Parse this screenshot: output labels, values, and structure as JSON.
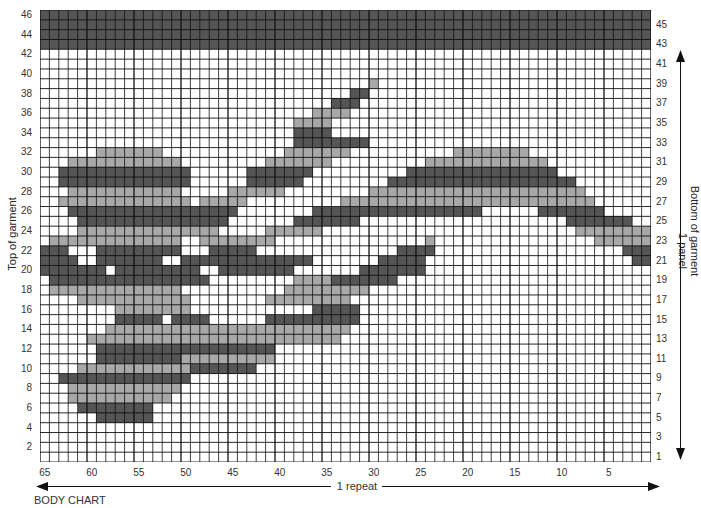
{
  "title": "BODY CHART",
  "left_axis_title": "Top of garment",
  "right_axis_title": "Bottom of garment",
  "right_axis_subtitle": "1 panel",
  "bottom_axis_title": "1 repeat",
  "grid": {
    "columns": 65,
    "rows": 46
  },
  "colors": {
    "light": "#a8a8a8",
    "dark": "#555555",
    "line": "#111111"
  },
  "left_row_labels": [
    "46",
    "44",
    "42",
    "40",
    "38",
    "36",
    "34",
    "32",
    "30",
    "28",
    "26",
    "24",
    "22",
    "20",
    "18",
    "16",
    "14",
    "12",
    "10",
    "8",
    "6",
    "4",
    "2"
  ],
  "right_row_labels": [
    "45",
    "43",
    "41",
    "39",
    "37",
    "35",
    "33",
    "31",
    "29",
    "27",
    "25",
    "23",
    "21",
    "19",
    "17",
    "15",
    "13",
    "11",
    "9",
    "7",
    "5",
    "3",
    "1"
  ],
  "column_labels": [
    "65",
    "60",
    "55",
    "50",
    "45",
    "40",
    "35",
    "30",
    "25",
    "20",
    "15",
    "10",
    "5"
  ],
  "pattern": [
    {
      "row": 46,
      "runs": [
        [
          "D",
          0,
          64
        ]
      ]
    },
    {
      "row": 45,
      "runs": [
        [
          "D",
          0,
          64
        ]
      ]
    },
    {
      "row": 44,
      "runs": [
        [
          "D",
          0,
          64
        ]
      ]
    },
    {
      "row": 43,
      "runs": [
        [
          "D",
          0,
          64
        ]
      ]
    },
    {
      "row": 39,
      "runs": [
        [
          "L",
          35,
          35
        ]
      ]
    },
    {
      "row": 38,
      "runs": [
        [
          "D",
          33,
          34
        ]
      ]
    },
    {
      "row": 37,
      "runs": [
        [
          "D",
          31,
          33
        ]
      ]
    },
    {
      "row": 36,
      "runs": [
        [
          "L",
          29,
          32
        ]
      ]
    },
    {
      "row": 35,
      "runs": [
        [
          "L",
          27,
          30
        ]
      ]
    },
    {
      "row": 34,
      "runs": [
        [
          "D",
          27,
          30
        ]
      ]
    },
    {
      "row": 33,
      "runs": [
        [
          "D",
          27,
          34
        ]
      ]
    },
    {
      "row": 32,
      "runs": [
        [
          "L",
          6,
          12
        ],
        [
          "L",
          26,
          32
        ],
        [
          "L",
          44,
          51
        ]
      ]
    },
    {
      "row": 31,
      "runs": [
        [
          "L",
          3,
          14
        ],
        [
          "L",
          24,
          30
        ],
        [
          "L",
          41,
          53
        ]
      ]
    },
    {
      "row": 30,
      "runs": [
        [
          "D",
          2,
          15
        ],
        [
          "D",
          22,
          28
        ],
        [
          "D",
          39,
          54
        ]
      ]
    },
    {
      "row": 29,
      "runs": [
        [
          "D",
          2,
          15
        ],
        [
          "D",
          22,
          27
        ],
        [
          "D",
          37,
          56
        ]
      ]
    },
    {
      "row": 28,
      "runs": [
        [
          "L",
          3,
          14
        ],
        [
          "L",
          20,
          25
        ],
        [
          "L",
          35,
          57
        ]
      ]
    },
    {
      "row": 27,
      "runs": [
        [
          "L",
          2,
          15
        ],
        [
          "L",
          17,
          21
        ],
        [
          "L",
          32,
          58
        ]
      ]
    },
    {
      "row": 26,
      "runs": [
        [
          "D",
          3,
          14
        ],
        [
          "D",
          15,
          20
        ],
        [
          "D",
          29,
          46
        ],
        [
          "D",
          53,
          59
        ]
      ]
    },
    {
      "row": 25,
      "runs": [
        [
          "D",
          4,
          15
        ],
        [
          "D",
          16,
          19
        ],
        [
          "D",
          27,
          33
        ],
        [
          "D",
          56,
          62
        ]
      ]
    },
    {
      "row": 24,
      "runs": [
        [
          "L",
          4,
          15
        ],
        [
          "L",
          16,
          18
        ],
        [
          "L",
          24,
          29
        ],
        [
          "L",
          57,
          64
        ]
      ]
    },
    {
      "row": 23,
      "runs": [
        [
          "L",
          1,
          14
        ],
        [
          "L",
          17,
          24
        ],
        [
          "L",
          41,
          41
        ],
        [
          "L",
          59,
          64
        ]
      ]
    },
    {
      "row": 22,
      "runs": [
        [
          "D",
          0,
          2
        ],
        [
          "D",
          6,
          14
        ],
        [
          "D",
          18,
          22
        ],
        [
          "D",
          38,
          41
        ],
        [
          "D",
          62,
          64
        ]
      ]
    },
    {
      "row": 21,
      "runs": [
        [
          "D",
          0,
          3
        ],
        [
          "D",
          6,
          12
        ],
        [
          "D",
          15,
          28
        ],
        [
          "D",
          36,
          40
        ],
        [
          "D",
          63,
          64
        ]
      ]
    },
    {
      "row": 20,
      "runs": [
        [
          "D",
          0,
          6
        ],
        [
          "D",
          8,
          16
        ],
        [
          "D",
          19,
          26
        ],
        [
          "D",
          34,
          40
        ]
      ]
    },
    {
      "row": 19,
      "runs": [
        [
          "D",
          1,
          17
        ],
        [
          "L",
          27,
          30
        ],
        [
          "D",
          31,
          37
        ]
      ]
    },
    {
      "row": 18,
      "runs": [
        [
          "L",
          1,
          14
        ],
        [
          "L",
          26,
          34
        ]
      ]
    },
    {
      "row": 17,
      "runs": [
        [
          "L",
          4,
          15
        ],
        [
          "L",
          24,
          32
        ]
      ]
    },
    {
      "row": 16,
      "runs": [
        [
          "L",
          8,
          15
        ],
        [
          "D",
          29,
          33
        ]
      ]
    },
    {
      "row": 15,
      "runs": [
        [
          "D",
          8,
          12
        ],
        [
          "D",
          14,
          17
        ],
        [
          "D",
          24,
          33
        ]
      ]
    },
    {
      "row": 14,
      "runs": [
        [
          "L",
          7,
          23
        ],
        [
          "L",
          24,
          32
        ]
      ]
    },
    {
      "row": 13,
      "runs": [
        [
          "L",
          5,
          31
        ]
      ]
    },
    {
      "row": 12,
      "runs": [
        [
          "D",
          6,
          24
        ]
      ]
    },
    {
      "row": 11,
      "runs": [
        [
          "D",
          6,
          14
        ],
        [
          "L",
          15,
          24
        ]
      ]
    },
    {
      "row": 10,
      "runs": [
        [
          "L",
          4,
          15
        ],
        [
          "D",
          16,
          22
        ]
      ]
    },
    {
      "row": 9,
      "runs": [
        [
          "D",
          2,
          15
        ]
      ]
    },
    {
      "row": 8,
      "runs": [
        [
          "L",
          3,
          14
        ]
      ]
    },
    {
      "row": 7,
      "runs": [
        [
          "L",
          3,
          13
        ]
      ]
    },
    {
      "row": 6,
      "runs": [
        [
          "D",
          4,
          11
        ]
      ]
    },
    {
      "row": 5,
      "runs": [
        [
          "D",
          6,
          11
        ]
      ]
    }
  ]
}
